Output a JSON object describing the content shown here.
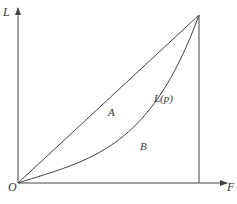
{
  "diagram": {
    "type": "lorenz-curve",
    "labels": {
      "y_axis": "L",
      "x_axis": "F",
      "origin": "O",
      "curve": "L(p)",
      "region_a": "A",
      "region_b": "B"
    },
    "colors": {
      "line": "#444444",
      "background": "#ffffff"
    }
  }
}
